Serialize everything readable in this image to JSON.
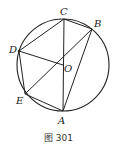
{
  "figure": {
    "caption": "图 301",
    "circle": {
      "cx": 63,
      "cy": 65,
      "r": 46
    },
    "points": {
      "A": {
        "label": "A",
        "x": 63,
        "y": 111
      },
      "B": {
        "label": "B",
        "x": 92,
        "y": 29
      },
      "C": {
        "label": "C",
        "x": 64,
        "y": 19
      },
      "D": {
        "label": "D",
        "x": 19,
        "y": 51
      },
      "E": {
        "label": "E",
        "x": 25,
        "y": 94
      },
      "O": {
        "label": "O",
        "x": 63,
        "y": 65
      }
    },
    "segments": [
      "CB",
      "CD",
      "CA",
      "DO",
      "DE",
      "EA",
      "EO",
      "OB",
      "BA"
    ],
    "stroke_color": "#222222"
  }
}
